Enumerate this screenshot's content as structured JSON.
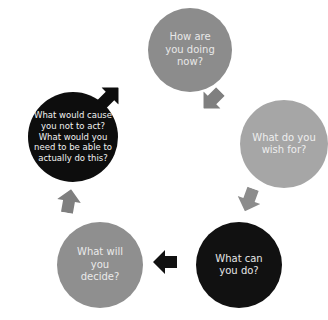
{
  "diagram": {
    "type": "cycle",
    "nodes": [
      {
        "id": "n1",
        "label": "How are you doing now?",
        "color": "#8c8c8c",
        "text_color": "#e8e8e8"
      },
      {
        "id": "n2",
        "label": "What do you wish for?",
        "color": "#a6a6a6",
        "text_color": "#eeeeee"
      },
      {
        "id": "n3",
        "label": "What can you do?",
        "color": "#111111",
        "text_color": "#e6e6e6"
      },
      {
        "id": "n4",
        "label": "What will you decide?",
        "color": "#8f8f8f",
        "text_color": "#eaeaea"
      },
      {
        "id": "n5",
        "label": "What would cause you not to act? What would you need to be able to actually do this?",
        "color": "#0d0d0d",
        "text_color": "#f2f2f2"
      }
    ],
    "arrows": [
      {
        "from": "n1",
        "to": "n2",
        "direction": "down-right",
        "color": "#7f7f7f"
      },
      {
        "from": "n2",
        "to": "n3",
        "direction": "down-left",
        "color": "#8c8c8c"
      },
      {
        "from": "n3",
        "to": "n4",
        "direction": "left",
        "color": "#111111"
      },
      {
        "from": "n4",
        "to": "n5",
        "direction": "up",
        "color": "#7f7f7f"
      },
      {
        "from": "n5",
        "to": "n1",
        "direction": "up-right",
        "color": "#0d0d0d"
      }
    ]
  }
}
